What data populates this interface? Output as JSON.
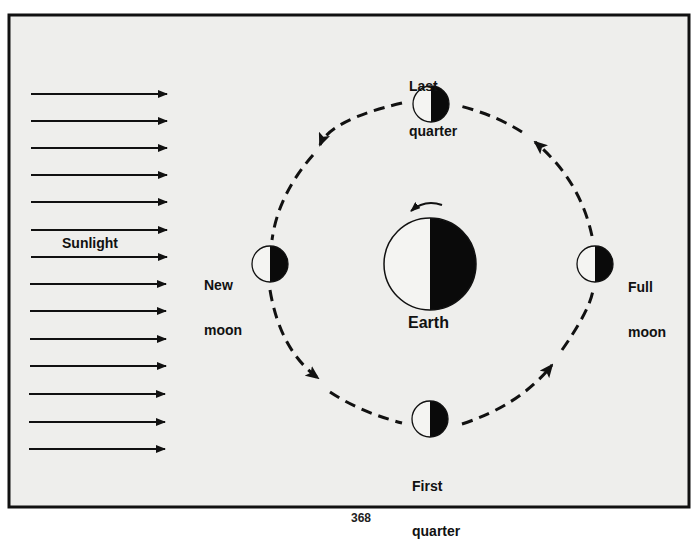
{
  "diagram": {
    "background_color": "#eeeeec",
    "frame_color": "#111111",
    "sunlight": {
      "label": "Sunlight",
      "arrow_count": 14,
      "direction": "left-to-right"
    },
    "earth": {
      "label": "Earth",
      "rotation_direction": "counterclockwise",
      "lit_side": "left",
      "dark_side": "right"
    },
    "moon_orbit": {
      "style": "dashed",
      "direction": "counterclockwise"
    },
    "moons": [
      {
        "id": "last-quarter",
        "label_line1": "Last",
        "label_line2": "quarter",
        "position": "top"
      },
      {
        "id": "new-moon",
        "label_line1": "New",
        "label_line2": "moon",
        "position": "left"
      },
      {
        "id": "full-moon",
        "label_line1": "Full",
        "label_line2": "moon",
        "position": "right"
      },
      {
        "id": "first-quarter",
        "label_line1": "First",
        "label_line2": "quarter",
        "position": "bottom"
      }
    ],
    "colors": {
      "lit": "#f4f4f2",
      "dark": "#0a0a0a",
      "line": "#111111"
    }
  },
  "page": {
    "number_partial": "368"
  }
}
